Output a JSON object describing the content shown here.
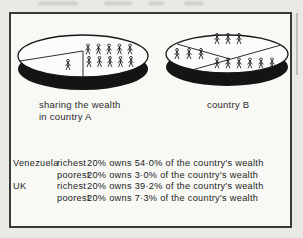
{
  "palette": {
    "ink": "#171717",
    "paper": "#f8f8f5",
    "outside_paper": "#e9e9e6"
  },
  "captions": {
    "pie_a_line1": "sharing the wealth",
    "pie_a_line2": "in country A",
    "pie_b": "country B"
  },
  "icons": {
    "person": "person-pictogram"
  },
  "chart_data": [
    {
      "type": "pie",
      "title": "sharing the wealth in country A",
      "style": "3d-oval-pictogram-pie",
      "slices": [
        {
          "label": "main section",
          "people_icons": 10
        },
        {
          "label": "small wedge",
          "people_icons": 1
        }
      ]
    },
    {
      "type": "pie",
      "title": "country B",
      "style": "3d-oval-pictogram-pie",
      "slices": [
        {
          "label": "top section",
          "people_icons": 3
        },
        {
          "label": "left section",
          "people_icons": 3
        },
        {
          "label": "bottom-right section",
          "people_icons": 6
        }
      ]
    },
    {
      "type": "table",
      "rows": [
        {
          "country": "Venezuela",
          "group": "richest",
          "detail": "20% owns 54·0% of the country's wealth",
          "share_pct": 54.0
        },
        {
          "country": "",
          "group": "poorest",
          "detail": "20% owns 3·0% of the country's wealth",
          "share_pct": 3.0
        },
        {
          "country": "UK",
          "group": "richest",
          "detail": "20% owns 39·2% of the country's wealth",
          "share_pct": 39.2
        },
        {
          "country": "",
          "group": "poorest",
          "detail": "20% owns 7·3% of the country's wealth",
          "share_pct": 7.3
        }
      ]
    }
  ]
}
